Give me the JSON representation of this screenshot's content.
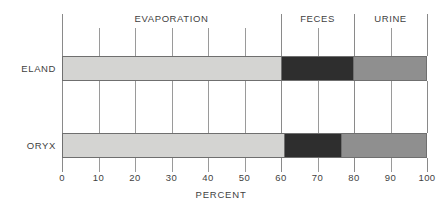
{
  "chart_data": {
    "type": "bar",
    "orientation": "horizontal",
    "stacked": true,
    "title": "",
    "xlabel": "PERCENT",
    "ylabel": "",
    "xlim": [
      0,
      100
    ],
    "grid": true,
    "legend_position": "top-inline",
    "categories": [
      "ELAND",
      "ORYX"
    ],
    "tick_values": [
      0,
      10,
      20,
      30,
      40,
      50,
      60,
      70,
      80,
      90,
      100
    ],
    "tick_labels": [
      "0",
      "10",
      "20",
      "30",
      "40",
      "50",
      "60",
      "70",
      "80",
      "90",
      "100"
    ],
    "series": [
      {
        "name": "EVAPORATION",
        "color": "#d4d4d2",
        "values": [
          60,
          61
        ]
      },
      {
        "name": "FECES",
        "color": "#2e2e2e",
        "values": [
          20,
          15.5
        ]
      },
      {
        "name": "URINE",
        "color": "#8f8f8f",
        "values": [
          20,
          23.5
        ]
      }
    ],
    "segment_headers": [
      {
        "label": "EVAPORATION",
        "center": 30
      },
      {
        "label": "FECES",
        "center": 70
      },
      {
        "label": "URINE",
        "center": 90
      }
    ],
    "category_dividers": [
      0,
      60,
      80,
      100
    ],
    "bars": [
      {
        "category": "ELAND",
        "segments": [
          {
            "name": "EVAPORATION",
            "value": 60,
            "start": 0,
            "end": 60,
            "color": "#d4d4d2"
          },
          {
            "name": "FECES",
            "value": 20,
            "start": 60,
            "end": 80,
            "color": "#2e2e2e"
          },
          {
            "name": "URINE",
            "value": 20,
            "start": 80,
            "end": 100,
            "color": "#8f8f8f"
          }
        ]
      },
      {
        "category": "ORYX",
        "segments": [
          {
            "name": "EVAPORATION",
            "value": 61,
            "start": 0,
            "end": 61,
            "color": "#d4d4d2"
          },
          {
            "name": "FECES",
            "value": 15.5,
            "start": 61,
            "end": 76.5,
            "color": "#2e2e2e"
          },
          {
            "name": "URINE",
            "value": 23.5,
            "start": 76.5,
            "end": 100,
            "color": "#8f8f8f"
          }
        ]
      }
    ]
  }
}
